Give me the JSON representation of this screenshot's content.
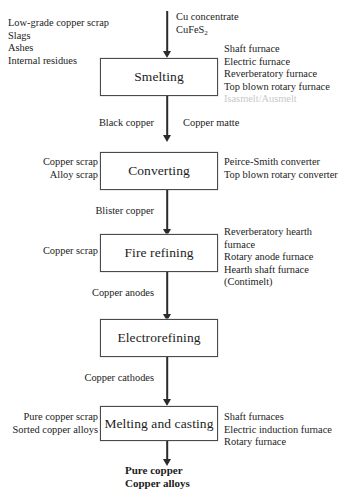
{
  "diagram": {
    "accent_color": "#4a4a4a",
    "line_color": "#2b2b2b"
  },
  "steps": [
    {
      "id": "smelting",
      "label": "Smelting"
    },
    {
      "id": "converting",
      "label": "Converting"
    },
    {
      "id": "fire_refining",
      "label": "Fire refining"
    },
    {
      "id": "electrorefining",
      "label": "Electrorefining"
    },
    {
      "id": "melting_casting",
      "label": "Melting and casting"
    }
  ],
  "inputs": {
    "smelting_left": "Low-grade copper scrap\nSlags\nAshes\nInternal residues",
    "smelting_top_line1": "Cu concentrate",
    "smelting_top_formula_prefix": "CuFeS",
    "smelting_top_formula_sub": "2",
    "converting_left": "Copper scrap\nAlloy scrap",
    "fire_refining_left": "Copper scrap",
    "melting_left": "Pure copper scrap\nSorted copper alloys"
  },
  "intermediates": {
    "black_copper": "Black copper",
    "copper_matte": "Copper matte",
    "blister_copper": "Blister copper",
    "copper_anodes": "Copper anodes",
    "copper_cathodes": "Copper cathodes"
  },
  "technologies": {
    "smelting": "Shaft furnace\nElectric furnace\nReverberatory furnace\nTop blown rotary furnace",
    "smelting_clipped": "Isasmelt/Ausmelt",
    "converting": "Peirce-Smith converter\nTop blown rotary converter",
    "fire_refining": "Reverberatory hearth\nfurnace\nRotary anode furnace\nHearth shaft furnace\n(Contimelt)",
    "melting_casting": "Shaft furnaces\nElectric induction furnace\nRotary furnace"
  },
  "outputs": {
    "final": "Pure copper\nCopper alloys"
  }
}
